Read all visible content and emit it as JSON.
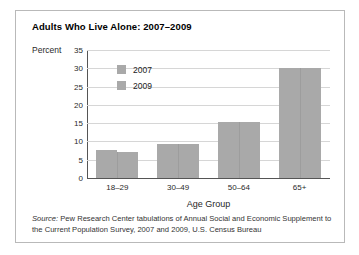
{
  "figure": {
    "title": "Adults Who Live Alone: 2007–2009",
    "source_label": "Source:",
    "source_text": " Pew Research Center tabulations of Annual Social and Economic Supplement to the Current Population Survey, 2007 and 2009, U.S. Census Bureau",
    "frame_color": "#b9b9b9",
    "background": "#ffffff"
  },
  "chart_data": {
    "type": "bar",
    "title": "Adults Who Live Alone: 2007–2009",
    "xlabel": "Age Group",
    "ylabel": "Percent",
    "categories": [
      "18–29",
      "30–49",
      "50–64",
      "65+"
    ],
    "series": [
      {
        "name": "2007",
        "values": [
          7.6,
          9.3,
          15.4,
          30.1
        ],
        "color": "#a9a9a9"
      },
      {
        "name": "2009",
        "values": [
          7.1,
          9.2,
          15.4,
          30.1
        ],
        "color": "#a9a9a9"
      }
    ],
    "ylim": [
      0,
      35
    ],
    "yticks": [
      0,
      5,
      10,
      15,
      20,
      25,
      30,
      35
    ],
    "ytick_labels": [
      "0",
      "5",
      "10",
      "15",
      "20",
      "25",
      "30",
      "35"
    ],
    "grid": true,
    "grid_axis": "y",
    "grid_color": "#d6d6d6",
    "axis_color": "#555555",
    "legend_position": "upper-left-inside",
    "legend_entries": [
      "2007",
      "2009"
    ]
  }
}
